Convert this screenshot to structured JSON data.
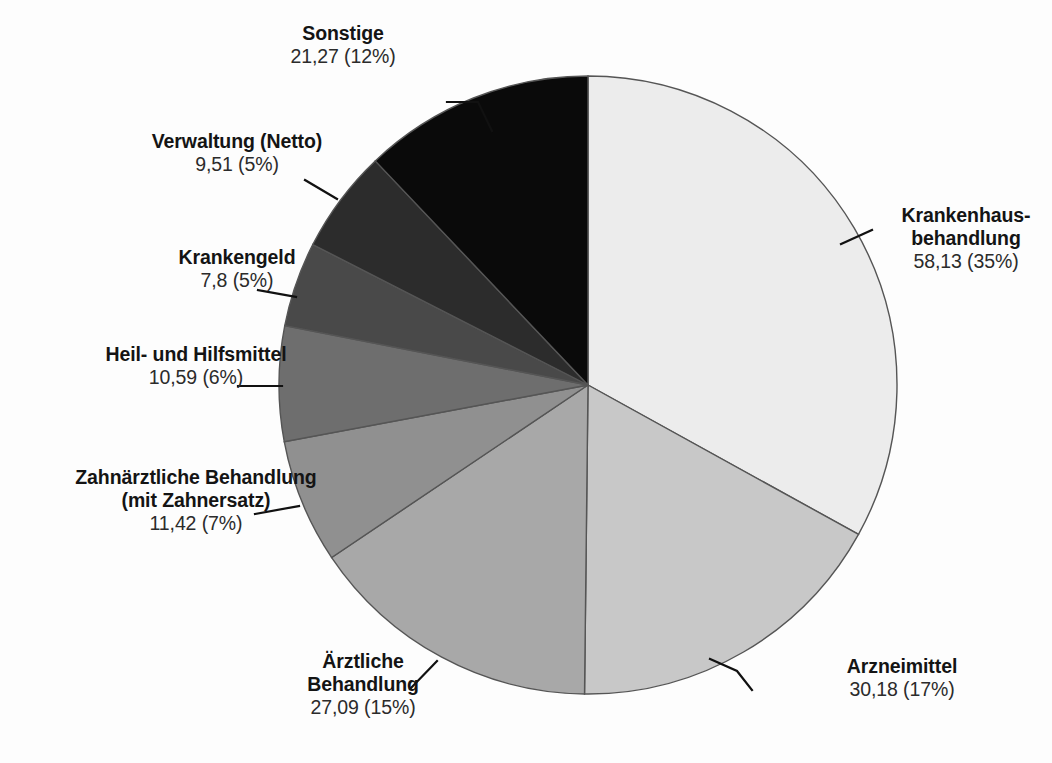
{
  "chart_data": {
    "type": "pie",
    "title": "",
    "subtitle": "",
    "xlabel": "",
    "ylabel": "",
    "legend_position": "none",
    "grid": false,
    "value_unit": "Mrd. Euro",
    "start_angle_deg": 0,
    "direction": "clockwise",
    "total": 176.0,
    "categories": [
      "Krankenhausbehandlung",
      "Arzneimittel",
      "Ärztliche Behandlung",
      "Zahnärztliche Behandlung (mit Zahnersatz)",
      "Heil- und Hilfsmittel",
      "Krankengeld",
      "Verwaltung (Netto)",
      "Sonstige"
    ],
    "values": [
      58.13,
      30.18,
      27.09,
      11.42,
      10.59,
      7.8,
      9.51,
      21.27
    ],
    "percents": [
      35,
      17,
      15,
      7,
      6,
      5,
      5,
      12
    ],
    "colors": [
      "#ececec",
      "#c8c8c8",
      "#a8a8a8",
      "#909090",
      "#6e6e6e",
      "#494949",
      "#2c2c2c",
      "#0a0a0a"
    ]
  },
  "slices": [
    {
      "id": "krankenhaus",
      "name_line1": "Krankenhaus-",
      "name_line2": "behandlung",
      "value_text": "58,13 (35%)",
      "value": 58.13,
      "percent": 35,
      "color": "#ececec"
    },
    {
      "id": "arzneimittel",
      "name_line1": "Arzneimittel",
      "name_line2": "",
      "value_text": "30,18 (17%)",
      "value": 30.18,
      "percent": 17,
      "color": "#c8c8c8"
    },
    {
      "id": "aerztliche",
      "name_line1": "Ärztliche",
      "name_line2": "Behandlung",
      "value_text": "27,09 (15%)",
      "value": 27.09,
      "percent": 15,
      "color": "#a8a8a8"
    },
    {
      "id": "zahnaerztliche",
      "name_line1": "Zahnärztliche Behandlung",
      "name_line2": "(mit Zahnersatz)",
      "value_text": "11,42 (7%)",
      "value": 11.42,
      "percent": 7,
      "color": "#909090"
    },
    {
      "id": "heilhilfsmittel",
      "name_line1": "Heil- und Hilfsmittel",
      "name_line2": "",
      "value_text": "10,59 (6%)",
      "value": 10.59,
      "percent": 6,
      "color": "#6e6e6e"
    },
    {
      "id": "krankengeld",
      "name_line1": "Krankengeld",
      "name_line2": "",
      "value_text": "7,8 (5%)",
      "value": 7.8,
      "percent": 5,
      "color": "#494949"
    },
    {
      "id": "verwaltung",
      "name_line1": "Verwaltung (Netto)",
      "name_line2": "",
      "value_text": "9,51 (5%)",
      "value": 9.51,
      "percent": 5,
      "color": "#2c2c2c"
    },
    {
      "id": "sonstige",
      "name_line1": "Sonstige",
      "name_line2": "",
      "value_text": "21,27 (12%)",
      "value": 21.27,
      "percent": 12,
      "color": "#0a0a0a"
    }
  ],
  "geometry": {
    "center_x": 588,
    "center_y": 385,
    "radius": 309,
    "stroke": "#555555"
  }
}
